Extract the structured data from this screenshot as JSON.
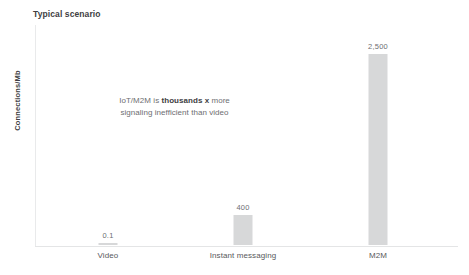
{
  "chart_data": {
    "type": "bar",
    "title": "Typical scenario",
    "xlabel": "",
    "ylabel": "Connections/Mb",
    "categories": [
      "Video",
      "Instant messaging",
      "M2M"
    ],
    "values": [
      0.1,
      400,
      2500
    ],
    "value_labels": [
      "0.1",
      "400",
      "2,500"
    ],
    "ylim": [
      0,
      2900
    ],
    "grid": false,
    "legend": null,
    "series": [
      {
        "name": "Connections/Mb",
        "values": [
          0.1,
          400,
          2500
        ],
        "color": "#d7d8d9"
      }
    ],
    "annotations": [
      {
        "line1_pre": "IoT/M2M is ",
        "line1_bold": "thousands x",
        "line1_post": " more",
        "line2": "signaling inefficient than video"
      }
    ]
  },
  "colors": {
    "bar": "#d7d8d9",
    "axis": "#e6e7e8",
    "title_text": "#404042",
    "label_text": "#58595b",
    "value_text": "#6d6e71"
  }
}
